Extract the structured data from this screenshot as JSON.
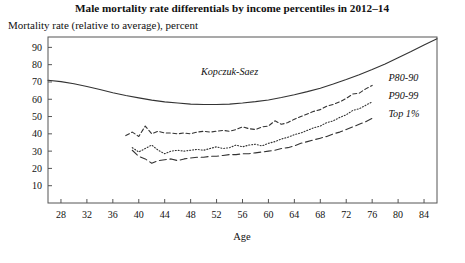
{
  "chart_data": {
    "type": "line",
    "title": "Male mortality rate differentials by income percentiles in 2012–14",
    "subtitle": "Mortality rate (relative to average), percent",
    "xlabel": "Age",
    "ylabel": "",
    "xlim": [
      26,
      86
    ],
    "ylim": [
      0,
      96
    ],
    "xticks": [
      28,
      32,
      36,
      40,
      44,
      48,
      52,
      56,
      60,
      64,
      68,
      72,
      76,
      80,
      84
    ],
    "yticks": [
      10,
      20,
      30,
      40,
      50,
      60,
      70,
      80,
      90
    ],
    "grid": false,
    "legend_position": "inline-right",
    "series": [
      {
        "name": "Kopczuk-Saez",
        "style": "solid",
        "label_x": 54,
        "label_y": 74,
        "x": [
          26,
          28,
          30,
          32,
          34,
          36,
          38,
          40,
          42,
          44,
          46,
          48,
          50,
          52,
          54,
          56,
          58,
          60,
          62,
          64,
          66,
          68,
          70,
          72,
          74,
          76,
          78,
          80,
          82,
          84,
          86
        ],
        "values": [
          71.0,
          70.2,
          69.0,
          67.4,
          65.6,
          63.8,
          62.2,
          60.8,
          59.5,
          58.5,
          57.8,
          57.2,
          57.0,
          57.0,
          57.2,
          57.8,
          58.6,
          59.6,
          61.0,
          62.6,
          64.4,
          66.4,
          68.8,
          71.4,
          74.2,
          77.2,
          80.4,
          84.0,
          87.6,
          91.4,
          95.0
        ]
      },
      {
        "name": "P80-90",
        "style": "dashed-short",
        "label_x": 78.5,
        "label_y": 70.5,
        "x": [
          38,
          39,
          40,
          41,
          42,
          43,
          44,
          45,
          46,
          47,
          48,
          49,
          50,
          51,
          52,
          53,
          54,
          55,
          56,
          57,
          58,
          59,
          60,
          61,
          62,
          63,
          64,
          65,
          66,
          67,
          68,
          69,
          70,
          71,
          72,
          73,
          74,
          75,
          76
        ],
        "values": [
          39.0,
          41.0,
          38.5,
          44.5,
          40.0,
          41.5,
          40.5,
          40.5,
          40.0,
          40.5,
          40.0,
          41.0,
          41.5,
          41.0,
          41.5,
          42.0,
          41.5,
          42.5,
          44.0,
          43.0,
          42.5,
          44.0,
          44.5,
          47.5,
          45.5,
          46.5,
          48.5,
          50.0,
          51.5,
          53.0,
          54.0,
          56.0,
          57.0,
          58.5,
          60.5,
          63.0,
          63.5,
          66.0,
          68.0
        ]
      },
      {
        "name": "P90-99",
        "style": "dotted",
        "label_x": 78.5,
        "label_y": 60.0,
        "x": [
          39,
          40,
          41,
          42,
          43,
          44,
          45,
          46,
          47,
          48,
          49,
          50,
          51,
          52,
          53,
          54,
          55,
          56,
          57,
          58,
          59,
          60,
          61,
          62,
          63,
          64,
          65,
          66,
          67,
          68,
          69,
          70,
          71,
          72,
          73,
          74,
          75,
          76
        ],
        "values": [
          32.0,
          29.5,
          31.5,
          33.5,
          30.5,
          28.5,
          30.0,
          30.5,
          30.0,
          30.5,
          31.0,
          30.5,
          31.5,
          32.5,
          31.5,
          32.0,
          33.5,
          32.5,
          33.5,
          34.0,
          33.0,
          34.5,
          35.5,
          37.0,
          38.0,
          39.5,
          40.5,
          42.0,
          43.5,
          44.5,
          46.5,
          47.5,
          49.5,
          51.0,
          53.5,
          54.5,
          56.5,
          58.5
        ]
      },
      {
        "name": "Top 1%",
        "style": "dashed-long",
        "label_x": 78.5,
        "label_y": 50.0,
        "x": [
          39,
          40,
          41,
          42,
          43,
          44,
          45,
          46,
          47,
          48,
          49,
          50,
          51,
          52,
          53,
          54,
          55,
          56,
          57,
          58,
          59,
          60,
          61,
          62,
          63,
          64,
          65,
          66,
          67,
          68,
          69,
          70,
          71,
          72,
          73,
          74,
          75,
          76
        ],
        "values": [
          30.5,
          27.0,
          25.5,
          23.0,
          24.5,
          25.0,
          25.5,
          24.5,
          25.5,
          26.0,
          26.5,
          26.5,
          27.0,
          27.0,
          27.5,
          28.0,
          28.0,
          28.5,
          28.5,
          29.0,
          29.5,
          30.0,
          30.5,
          31.5,
          32.0,
          33.0,
          34.5,
          35.5,
          36.5,
          37.5,
          38.5,
          40.0,
          41.0,
          42.5,
          44.0,
          45.5,
          47.0,
          49.0
        ]
      }
    ]
  }
}
